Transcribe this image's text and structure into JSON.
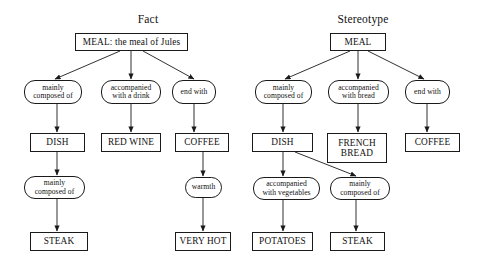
{
  "figure": {
    "background": "#ffffff",
    "stroke": "#1a1a1a",
    "text_color": "#111111",
    "width": 486,
    "height": 269
  },
  "panels": [
    {
      "id": "fact",
      "title": "Fact",
      "title_x": 148,
      "title_y": 13
    },
    {
      "id": "stereotype",
      "title": "Stereotype",
      "title_x": 363,
      "title_y": 13
    }
  ],
  "nodes": [
    {
      "id": "f-meal",
      "panel": "fact",
      "shape": "rect",
      "label": "MEAL: the meal of Jules",
      "x": 75,
      "y": 33,
      "w": 113,
      "h": 18
    },
    {
      "id": "f-rel-1",
      "panel": "fact",
      "shape": "round",
      "label": "mainly\ncomposed of",
      "x": 24,
      "y": 80,
      "w": 58,
      "h": 24
    },
    {
      "id": "f-rel-2",
      "panel": "fact",
      "shape": "round",
      "label": "accompanied\nwith a drink",
      "x": 101,
      "y": 80,
      "w": 60,
      "h": 24
    },
    {
      "id": "f-rel-3",
      "panel": "fact",
      "shape": "round",
      "label": "end with",
      "x": 172,
      "y": 80,
      "w": 44,
      "h": 24
    },
    {
      "id": "f-dish",
      "panel": "fact",
      "shape": "rect",
      "label": "DISH",
      "x": 30,
      "y": 133,
      "w": 55,
      "h": 19
    },
    {
      "id": "f-redwine",
      "panel": "fact",
      "shape": "rect",
      "label": "RED WINE",
      "x": 101,
      "y": 133,
      "w": 60,
      "h": 19
    },
    {
      "id": "f-coffee",
      "panel": "fact",
      "shape": "rect",
      "label": "COFFEE",
      "x": 175,
      "y": 133,
      "w": 54,
      "h": 19
    },
    {
      "id": "f-rel-4",
      "panel": "fact",
      "shape": "round",
      "label": "mainly\ncomposed of",
      "x": 24,
      "y": 176,
      "w": 61,
      "h": 23
    },
    {
      "id": "f-warmth",
      "panel": "fact",
      "shape": "round",
      "label": "warmth",
      "x": 185,
      "y": 177,
      "w": 37,
      "h": 21
    },
    {
      "id": "f-steak",
      "panel": "fact",
      "shape": "rect",
      "label": "STEAK",
      "x": 30,
      "y": 232,
      "w": 58,
      "h": 19
    },
    {
      "id": "f-veryhot",
      "panel": "fact",
      "shape": "rect",
      "label": "VERY HOT",
      "x": 175,
      "y": 232,
      "w": 56,
      "h": 19
    },
    {
      "id": "s-meal",
      "panel": "stereotype",
      "shape": "rect",
      "label": "MEAL",
      "x": 330,
      "y": 33,
      "w": 56,
      "h": 18
    },
    {
      "id": "s-rel-1",
      "panel": "stereotype",
      "shape": "round",
      "label": "mainly\ncomposed of",
      "x": 255,
      "y": 80,
      "w": 57,
      "h": 24
    },
    {
      "id": "s-rel-2",
      "panel": "stereotype",
      "shape": "round",
      "label": "accompanied\nwith bread",
      "x": 328,
      "y": 80,
      "w": 61,
      "h": 24
    },
    {
      "id": "s-rel-3",
      "panel": "stereotype",
      "shape": "round",
      "label": "end with",
      "x": 405,
      "y": 80,
      "w": 45,
      "h": 24
    },
    {
      "id": "s-dish",
      "panel": "stereotype",
      "shape": "rect",
      "label": "DISH",
      "x": 252,
      "y": 133,
      "w": 61,
      "h": 19
    },
    {
      "id": "s-frenchbread",
      "panel": "stereotype",
      "shape": "rect",
      "label": "FRENCH\nBREAD",
      "x": 327,
      "y": 133,
      "w": 60,
      "h": 30
    },
    {
      "id": "s-coffee",
      "panel": "stereotype",
      "shape": "rect",
      "label": "COFFEE",
      "x": 405,
      "y": 133,
      "w": 55,
      "h": 19
    },
    {
      "id": "s-rel-4",
      "panel": "stereotype",
      "shape": "round",
      "label": "accompanied\nwith vegetables",
      "x": 253,
      "y": 177,
      "w": 67,
      "h": 23
    },
    {
      "id": "s-rel-5",
      "panel": "stereotype",
      "shape": "round",
      "label": "mainly\ncomposed of",
      "x": 330,
      "y": 177,
      "w": 60,
      "h": 23
    },
    {
      "id": "s-potatoes",
      "panel": "stereotype",
      "shape": "rect",
      "label": "POTATOES",
      "x": 252,
      "y": 232,
      "w": 61,
      "h": 19
    },
    {
      "id": "s-steak",
      "panel": "stereotype",
      "shape": "rect",
      "label": "STEAK",
      "x": 330,
      "y": 232,
      "w": 55,
      "h": 19
    }
  ],
  "edges": [
    {
      "from": "f-meal",
      "to": "f-rel-1",
      "x1": 120,
      "y1": 51,
      "x2": 55,
      "y2": 79
    },
    {
      "from": "f-meal",
      "to": "f-rel-2",
      "x1": 131,
      "y1": 51,
      "x2": 131,
      "y2": 79
    },
    {
      "from": "f-meal",
      "to": "f-rel-3",
      "x1": 143,
      "y1": 51,
      "x2": 194,
      "y2": 79
    },
    {
      "from": "f-rel-1",
      "to": "f-dish",
      "x1": 57,
      "y1": 104,
      "x2": 57,
      "y2": 132
    },
    {
      "from": "f-rel-2",
      "to": "f-redwine",
      "x1": 131,
      "y1": 104,
      "x2": 131,
      "y2": 132
    },
    {
      "from": "f-rel-3",
      "to": "f-coffee",
      "x1": 194,
      "y1": 104,
      "x2": 194,
      "y2": 132
    },
    {
      "from": "f-dish",
      "to": "f-rel-4",
      "x1": 57,
      "y1": 152,
      "x2": 57,
      "y2": 175
    },
    {
      "from": "f-coffee",
      "to": "f-warmth",
      "x1": 203,
      "y1": 152,
      "x2": 203,
      "y2": 176
    },
    {
      "from": "f-rel-4",
      "to": "f-steak",
      "x1": 57,
      "y1": 199,
      "x2": 57,
      "y2": 231
    },
    {
      "from": "f-warmth",
      "to": "f-veryhot",
      "x1": 203,
      "y1": 198,
      "x2": 203,
      "y2": 231
    },
    {
      "from": "s-meal",
      "to": "s-rel-1",
      "x1": 350,
      "y1": 51,
      "x2": 285,
      "y2": 79
    },
    {
      "from": "s-meal",
      "to": "s-rel-2",
      "x1": 358,
      "y1": 51,
      "x2": 358,
      "y2": 79
    },
    {
      "from": "s-meal",
      "to": "s-rel-3",
      "x1": 368,
      "y1": 51,
      "x2": 424,
      "y2": 79
    },
    {
      "from": "s-rel-1",
      "to": "s-dish",
      "x1": 283,
      "y1": 104,
      "x2": 283,
      "y2": 132
    },
    {
      "from": "s-rel-2",
      "to": "s-frenchbread",
      "x1": 358,
      "y1": 104,
      "x2": 358,
      "y2": 132
    },
    {
      "from": "s-rel-3",
      "to": "s-coffee",
      "x1": 427,
      "y1": 104,
      "x2": 427,
      "y2": 132
    },
    {
      "from": "s-dish",
      "to": "s-rel-4",
      "x1": 283,
      "y1": 152,
      "x2": 283,
      "y2": 176
    },
    {
      "from": "s-dish",
      "to": "s-rel-5",
      "x1": 295,
      "y1": 152,
      "x2": 356,
      "y2": 176
    },
    {
      "from": "s-rel-4",
      "to": "s-potatoes",
      "x1": 283,
      "y1": 200,
      "x2": 283,
      "y2": 231
    },
    {
      "from": "s-rel-5",
      "to": "s-steak",
      "x1": 356,
      "y1": 200,
      "x2": 356,
      "y2": 231
    }
  ]
}
